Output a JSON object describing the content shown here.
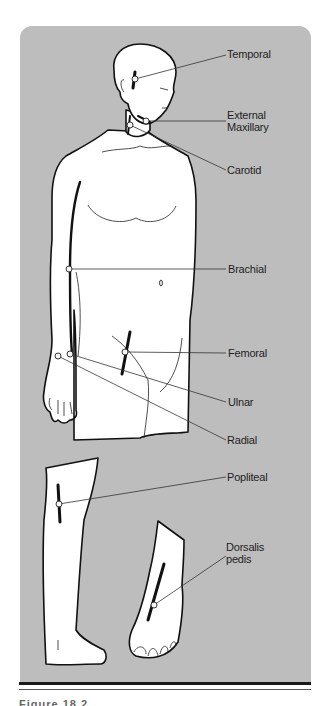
{
  "figure": {
    "panel_color": "#bdbdbd",
    "labels": [
      {
        "id": "temporal",
        "lines": [
          "Temporal"
        ]
      },
      {
        "id": "external-maxillary",
        "lines": [
          "External",
          "Maxillary"
        ]
      },
      {
        "id": "carotid",
        "lines": [
          "Carotid"
        ]
      },
      {
        "id": "brachial",
        "lines": [
          "Brachial"
        ]
      },
      {
        "id": "femoral",
        "lines": [
          "Femoral"
        ]
      },
      {
        "id": "ulnar",
        "lines": [
          "Ulnar"
        ]
      },
      {
        "id": "radial",
        "lines": [
          "Radial"
        ]
      },
      {
        "id": "popliteal",
        "lines": [
          "Popliteal"
        ]
      },
      {
        "id": "dorsalis-pedis",
        "lines": [
          "Dorsalis",
          "pedis"
        ]
      }
    ],
    "views": [
      "upper body",
      "leg (side view)",
      "foot (top view)"
    ]
  },
  "caption": {
    "text": "Figure 18.2"
  }
}
